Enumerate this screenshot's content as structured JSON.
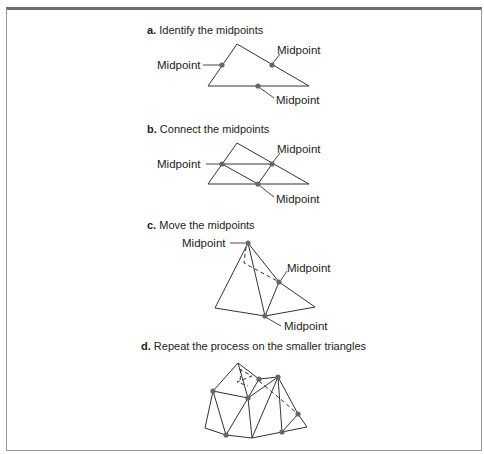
{
  "figure": {
    "steps": [
      {
        "letter": "a.",
        "title": " Identify the midpoints",
        "labels": [
          "Midpoint",
          "Midpoint",
          "Midpoint"
        ]
      },
      {
        "letter": "b.",
        "title": " Connect the midpoints",
        "labels": [
          "Midpoint",
          "Midpoint",
          "Midpoint"
        ]
      },
      {
        "letter": "c.",
        "title": " Move the midpoints",
        "labels": [
          "Midpoint",
          "Midpoint",
          "Midpoint"
        ]
      },
      {
        "letter": "d.",
        "title": " Repeat the process on the smaller triangles",
        "labels": []
      }
    ]
  },
  "colors": {
    "line": "#333333",
    "point": "#666666",
    "frame": "#9a9a9a",
    "frame_top": "#6e6e6e"
  }
}
